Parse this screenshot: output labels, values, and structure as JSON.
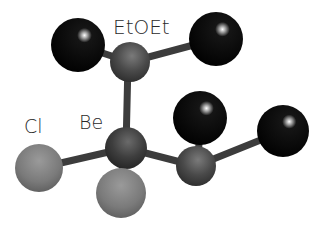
{
  "labels": {
    "ether": "EtOEt",
    "chlorine": "Cl",
    "beryllium": "Be"
  },
  "colors": {
    "carbon": "#050505",
    "oxygen": "#4a4a4a",
    "beryllium": "#3a3a3a",
    "chlorine": "#7c7c7c",
    "bond": "#3a3a3a",
    "text": "#2a2a2a"
  },
  "atoms": [
    {
      "id": "C1",
      "element": "C",
      "cx": 78,
      "cy": 45,
      "r": 27
    },
    {
      "id": "C2",
      "element": "C",
      "cx": 216,
      "cy": 39,
      "r": 27
    },
    {
      "id": "O1",
      "element": "O",
      "cx": 130,
      "cy": 62,
      "r": 20
    },
    {
      "id": "Be",
      "element": "Be",
      "cx": 126,
      "cy": 148,
      "r": 21
    },
    {
      "id": "C3",
      "element": "C",
      "cx": 200,
      "cy": 118,
      "r": 27
    },
    {
      "id": "O2",
      "element": "O",
      "cx": 196,
      "cy": 166,
      "r": 20
    },
    {
      "id": "C4",
      "element": "C",
      "cx": 283,
      "cy": 131,
      "r": 26
    },
    {
      "id": "Cl1",
      "element": "Cl",
      "cx": 39,
      "cy": 168,
      "r": 24
    },
    {
      "id": "Cl2",
      "element": "Cl",
      "cx": 121,
      "cy": 193,
      "r": 25
    }
  ]
}
